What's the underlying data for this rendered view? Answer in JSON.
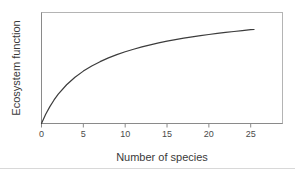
{
  "chart_data": {
    "type": "line",
    "title": "",
    "subtitle": "",
    "xlabel": "Number of species",
    "ylabel": "Ecosystem function",
    "xlim": [
      0,
      28.8
    ],
    "ylim": [
      0,
      1.0
    ],
    "xticks": [
      0,
      5,
      10,
      15,
      20,
      25
    ],
    "xticklabels": [
      "0",
      "5",
      "10",
      "15",
      "20",
      "25"
    ],
    "yticks": [],
    "yticklabels": [],
    "grid": false,
    "legend": null,
    "annotations": [],
    "frame": "box",
    "series": [
      {
        "name": "Ecosystem function vs species richness",
        "shape": "saturating",
        "x": [
          0,
          0.5,
          1,
          1.5,
          2,
          3,
          4,
          5,
          6,
          7,
          8,
          9,
          10,
          11,
          12,
          13,
          14,
          15,
          16,
          17,
          18,
          19,
          20,
          21,
          22,
          23,
          24,
          25,
          25.4
        ],
        "values": [
          0.0,
          0.083,
          0.152,
          0.212,
          0.264,
          0.349,
          0.417,
          0.472,
          0.518,
          0.557,
          0.591,
          0.62,
          0.646,
          0.669,
          0.69,
          0.709,
          0.726,
          0.742,
          0.756,
          0.769,
          0.781,
          0.792,
          0.802,
          0.812,
          0.821,
          0.829,
          0.837,
          0.845,
          0.847
        ]
      }
    ]
  },
  "colors": {
    "curve": "#3c3c3c",
    "frame": "#b4b4b4",
    "axis": "#8a8a8a",
    "text": "#3a3a3a",
    "tick_text": "#4a4a4a",
    "background": "#ffffff"
  }
}
